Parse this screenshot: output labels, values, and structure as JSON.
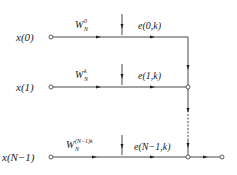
{
  "diagram": {
    "rows": [
      {
        "input": "x(0)",
        "twiddle_base": "W",
        "twiddle_sup": "0",
        "twiddle_sub": "N",
        "error_label": "e(0,k)"
      },
      {
        "input": "x(1)",
        "twiddle_base": "W",
        "twiddle_sup": "k",
        "twiddle_sub": "N",
        "error_label": "e(1,k)"
      },
      {
        "input": "x(N−1)",
        "twiddle_base": "W",
        "twiddle_sup": "(N−1)k",
        "twiddle_sub": "N",
        "error_label": "e(N−1,k)"
      }
    ]
  }
}
